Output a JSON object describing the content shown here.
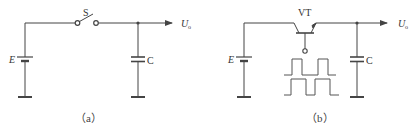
{
  "diagram_a": {
    "caption": "（a）",
    "switch_label": "S",
    "source_label": "E",
    "capacitor_label": "C",
    "output_label": "U",
    "output_subscript": "o"
  },
  "diagram_b": {
    "caption": "（b）",
    "transistor_label": "VT",
    "source_label": "E",
    "capacitor_label": "C",
    "output_label": "U",
    "output_subscript": "o"
  },
  "colors": {
    "stroke": "#444444",
    "text": "#333333",
    "background": "#ffffff"
  }
}
